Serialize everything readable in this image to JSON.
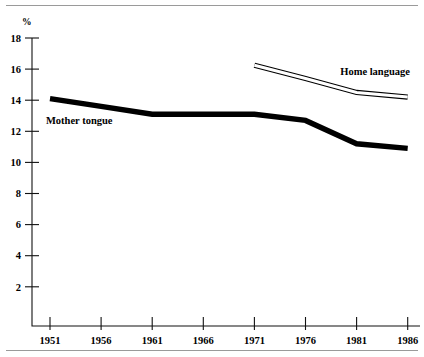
{
  "figure": {
    "unit_label": "%",
    "top_rule": true,
    "bottom_rule": true
  },
  "chart_data": {
    "type": "line",
    "title": "",
    "xlabel": "",
    "ylabel": "%",
    "x": [
      1951,
      1956,
      1961,
      1966,
      1971,
      1976,
      1981,
      1986
    ],
    "categories": [
      "1951",
      "1956",
      "1961",
      "1966",
      "1971",
      "1976",
      "1981",
      "1986"
    ],
    "xlim": [
      1949.5,
      1987.5
    ],
    "ylim": [
      0,
      18
    ],
    "yticks": [
      2,
      4,
      6,
      8,
      10,
      12,
      14,
      16,
      18
    ],
    "ytick_labels": [
      "2",
      "4",
      "6",
      "8",
      "10",
      "12",
      "14",
      "16",
      "18"
    ],
    "xticks": [
      1951,
      1956,
      1961,
      1966,
      1971,
      1976,
      1981,
      1986
    ],
    "xtick_labels": [
      "1951",
      "1956",
      "1961",
      "1966",
      "1971",
      "1976",
      "1981",
      "1986"
    ],
    "grid": false,
    "legend": "inline-annotations",
    "series": [
      {
        "name": "Mother tongue",
        "style": "solid-thick-black",
        "color": "#000000",
        "label_anchor": {
          "x": 1950.6,
          "y": 12.45
        },
        "x": [
          1951,
          1956,
          1961,
          1966,
          1971,
          1976,
          1981,
          1986
        ],
        "values": [
          14.1,
          13.6,
          13.1,
          13.1,
          13.1,
          12.7,
          11.2,
          10.9
        ]
      },
      {
        "name": "Home language",
        "style": "hollow-outlined",
        "color": "#000000",
        "label_anchor": {
          "x": 1979.4,
          "y": 15.6
        },
        "x": [
          1971,
          1976,
          1981,
          1986
        ],
        "values": [
          16.25,
          15.4,
          14.5,
          14.2
        ]
      }
    ]
  }
}
